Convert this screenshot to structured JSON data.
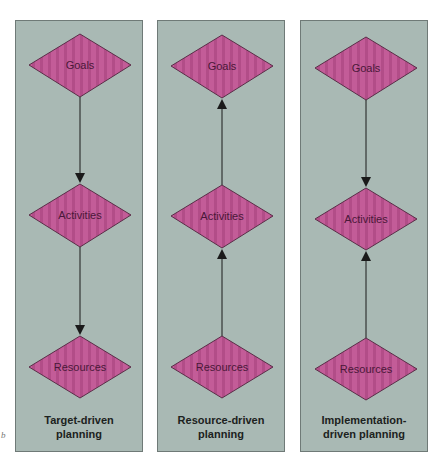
{
  "colors": {
    "panel_bg": "#a9b9b4",
    "panel_border": "#6f7a77",
    "diamond_fill": "#c35c98",
    "diamond_stripe": "#b24d88",
    "diamond_border": "#5a2e48",
    "label_text": "#4a1838",
    "caption_text": "#1c2220",
    "arrow": "#1a1a1a"
  },
  "corner_mark": "b",
  "panels": [
    {
      "caption_line1": "Target-driven",
      "caption_line2": "planning",
      "nodes": [
        "Goals",
        "Activities",
        "Resources"
      ],
      "flow": "Goals → Activities → Resources (downward arrows)"
    },
    {
      "caption_line1": "Resource-driven",
      "caption_line2": "planning",
      "nodes": [
        "Goals",
        "Activities",
        "Resources"
      ],
      "flow": "Resources → Activities → Goals (upward arrows)"
    },
    {
      "caption_line1": "Implementation-",
      "caption_line2": "driven planning",
      "nodes": [
        "Goals",
        "Activities",
        "Resources"
      ],
      "flow": "Goals → Activities ← Resources (arrows converge on Activities)"
    }
  ]
}
